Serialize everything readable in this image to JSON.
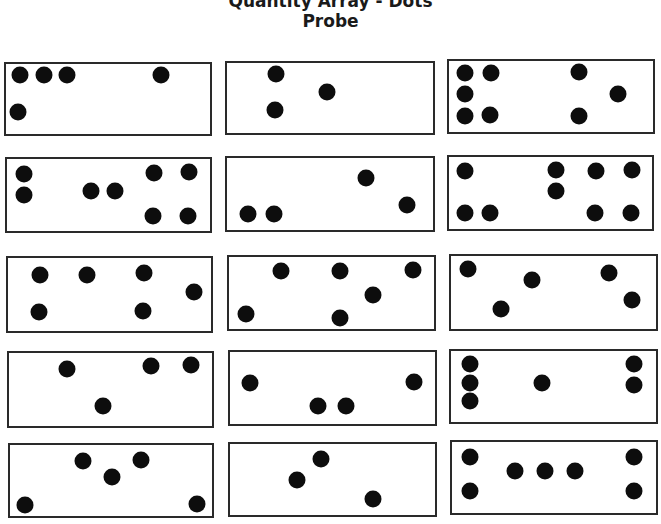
{
  "header": {
    "title_line1": "Quantity Array - Dots",
    "title_line2": "Probe"
  },
  "colors": {
    "dot": "#0d0d0d",
    "border": "#2a2a2a",
    "background": "#ffffff"
  },
  "cards": [
    {
      "dot_count": 5
    },
    {
      "dot_count": 3
    },
    {
      "dot_count": 8
    },
    {
      "dot_count": 8
    },
    {
      "dot_count": 4
    },
    {
      "dot_count": 9
    },
    {
      "dot_count": 6
    },
    {
      "dot_count": 6
    },
    {
      "dot_count": 5
    },
    {
      "dot_count": 4
    },
    {
      "dot_count": 4
    },
    {
      "dot_count": 6
    },
    {
      "dot_count": 5
    },
    {
      "dot_count": 3
    },
    {
      "dot_count": 7
    }
  ]
}
